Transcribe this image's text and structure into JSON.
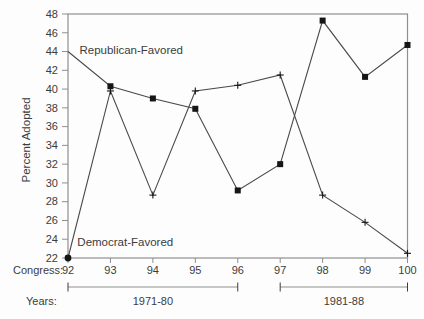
{
  "chart_data": {
    "type": "line",
    "ylabel": "Percent Adopted",
    "ylim": [
      22,
      48
    ],
    "ytick_step": 2,
    "x": [
      92,
      93,
      94,
      95,
      96,
      97,
      98,
      99,
      100
    ],
    "x_axis_prefix": "Congress:",
    "series": [
      {
        "name": "Republican-Favored",
        "marker": "square",
        "first_point_marker": "none",
        "values": [
          44,
          40.3,
          39,
          37.9,
          29.2,
          32,
          47.3,
          41.3,
          44.7
        ]
      },
      {
        "name": "Democrat-Favored",
        "marker": "plus",
        "first_point_marker": "dot",
        "values": [
          22,
          39.8,
          28.7,
          39.8,
          40.4,
          41.5,
          28.7,
          25.8,
          22.5
        ]
      }
    ],
    "annotations": [
      {
        "text": "Republican-Favored",
        "x": 92.27,
        "y": 44.2
      },
      {
        "text": "Democrat-Favored",
        "x": 92.22,
        "y": 23.7
      }
    ],
    "years_axis": {
      "label": "Years:",
      "ranges": [
        {
          "label": "1971-80",
          "from": 92,
          "to": 96
        },
        {
          "label": "1981-88",
          "from": 97,
          "to": 100
        }
      ]
    },
    "colors": {
      "line": "#4a4a4a",
      "marker": "#151515",
      "frame": "#8f8f8f",
      "bracket": "#8f8f8f",
      "text": "#3c3c3c"
    },
    "grid": false,
    "legend_position": "none"
  }
}
